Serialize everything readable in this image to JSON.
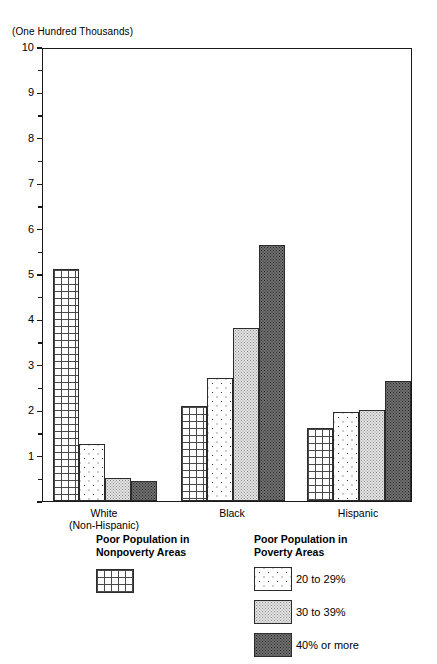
{
  "units_note": "(One Hundred Thousands)",
  "chart_data": {
    "type": "bar",
    "title": "",
    "subtitle": "",
    "xlabel": "",
    "ylabel": "(One Hundred Thousands)",
    "ylim": [
      0,
      10
    ],
    "y_major_ticks": [
      0,
      1,
      2,
      3,
      4,
      5,
      6,
      7,
      8,
      9,
      10
    ],
    "y_major_tick_labels": [
      "",
      "1",
      "2",
      "3",
      "4",
      "5",
      "6",
      "7",
      "8",
      "9",
      "10"
    ],
    "y_minor_ticks": [
      0.5,
      1.5,
      2.5,
      3.5,
      4.5,
      5.5,
      6.5,
      7.5,
      8.5,
      9.5
    ],
    "grid": false,
    "legend_position": "below",
    "categories": [
      "White (Non-Hispanic)",
      "Black",
      "Hispanic"
    ],
    "category_labels": [
      [
        "White",
        "(Non-Hispanic)"
      ],
      [
        "Black"
      ],
      [
        "Hispanic"
      ]
    ],
    "series": [
      {
        "name": "Poor Population in Nonpoverty Areas",
        "pattern": "grid",
        "values": [
          5.1,
          2.1,
          1.6
        ]
      },
      {
        "name": "20 to 29%",
        "pattern": "dots",
        "values": [
          1.25,
          2.7,
          1.95
        ]
      },
      {
        "name": "30 to 39%",
        "pattern": "stipple-light",
        "values": [
          0.5,
          3.8,
          2.0
        ]
      },
      {
        "name": "40% or more",
        "pattern": "stipple-dark",
        "values": [
          0.45,
          5.65,
          2.65
        ]
      }
    ]
  },
  "legend": {
    "nonpoverty": {
      "heading_line1": "Poor Population in",
      "heading_line2": "Nonpoverty Areas",
      "swatch_name": "grid-pattern-swatch"
    },
    "poverty": {
      "heading_line1": "Poor Population in",
      "heading_line2": "Poverty Areas",
      "items": [
        {
          "label": "20 to 29%",
          "pattern": "dots"
        },
        {
          "label": "30 to 39%",
          "pattern": "stipple-light"
        },
        {
          "label": "40% or more",
          "pattern": "stipple-dark"
        }
      ]
    }
  },
  "colors": {
    "axis": "#1a1a1a",
    "bar_outline": "#2b2b2b",
    "stipple_light_fill": "#e3e3e3",
    "stipple_dark_fill": "#6f6f6f",
    "background": "#ffffff"
  }
}
